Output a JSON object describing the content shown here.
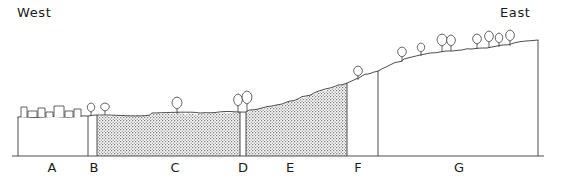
{
  "figure": {
    "type": "landscape-cross-section",
    "orientation_labels": {
      "west": "West",
      "east": "East"
    },
    "baseline_y": 156,
    "ground_left_x": 18,
    "ground_right_x": 538,
    "zones": [
      {
        "id": "A",
        "label": "A",
        "label_x": 52,
        "label_y": 168,
        "x_start": 18,
        "x_end": 88,
        "fill": "none",
        "top_y": 117,
        "surface_feature": "buildings"
      },
      {
        "id": "B",
        "label": "B",
        "label_x": 94,
        "label_y": 168,
        "x_start": 88,
        "x_end": 97,
        "fill": "none",
        "top_y": 116,
        "surface_feature": "trees"
      },
      {
        "id": "C",
        "label": "C",
        "label_x": 175,
        "label_y": 168,
        "x_start": 97,
        "x_end": 240,
        "fill": "stipple",
        "top_y": 115,
        "surface_feature": "tree"
      },
      {
        "id": "D",
        "label": "D",
        "label_x": 243,
        "label_y": 168,
        "x_start": 240,
        "x_end": 246,
        "fill": "none",
        "top_y": 112,
        "surface_feature": "trees"
      },
      {
        "id": "E",
        "label": "E",
        "label_x": 290,
        "label_y": 168,
        "x_start": 246,
        "x_end": 347,
        "fill": "stipple",
        "top_y": 110,
        "surface_feature": "slope"
      },
      {
        "id": "F",
        "label": "F",
        "label_x": 358,
        "label_y": 168,
        "x_start": 347,
        "x_end": 378,
        "fill": "none",
        "top_y": 84,
        "surface_feature": "tree"
      },
      {
        "id": "G",
        "label": "G",
        "label_x": 459,
        "label_y": 168,
        "x_start": 378,
        "x_end": 538,
        "fill": "none",
        "top_y": 41,
        "surface_feature": "trees"
      }
    ],
    "terrain_profile": "M18,117 L88,116 L97,115 L150,115 L152,113 L200,113 L240,112 L246,112 L250,110 L262,108 L272,106 L282,104 L290,101 L298,99 L306,96 L314,93 L322,90 L330,88 L338,85 L347,83 L356,79 L362,76 L368,74 L374,72 L380,70 L386,67 L392,64 L398,62 L404,59 L412,57 L420,55 L430,53 L440,52 L452,51 L462,50 L472,49 L482,48 L492,47 L502,45 L514,43 L526,41 L538,40",
    "trees": [
      {
        "x": 91,
        "base_y": 116,
        "height": 13,
        "canopy_w": 6,
        "canopy_h": 9
      },
      {
        "x": 105,
        "base_y": 115,
        "height": 12,
        "canopy_w": 7,
        "canopy_h": 8
      },
      {
        "x": 177,
        "base_y": 114,
        "height": 17,
        "canopy_w": 8,
        "canopy_h": 12
      },
      {
        "x": 238,
        "base_y": 113,
        "height": 19,
        "canopy_w": 7,
        "canopy_h": 12
      },
      {
        "x": 247,
        "base_y": 112,
        "height": 21,
        "canopy_w": 8,
        "canopy_h": 13
      },
      {
        "x": 358,
        "base_y": 80,
        "height": 14,
        "canopy_w": 7,
        "canopy_h": 10
      },
      {
        "x": 402,
        "base_y": 62,
        "height": 15,
        "canopy_w": 7,
        "canopy_h": 10
      },
      {
        "x": 421,
        "base_y": 56,
        "height": 13,
        "canopy_w": 6,
        "canopy_h": 9
      },
      {
        "x": 442,
        "base_y": 52,
        "height": 18,
        "canopy_w": 8,
        "canopy_h": 12
      },
      {
        "x": 451,
        "base_y": 51,
        "height": 16,
        "canopy_w": 7,
        "canopy_h": 11
      },
      {
        "x": 477,
        "base_y": 49,
        "height": 15,
        "canopy_w": 7,
        "canopy_h": 10
      },
      {
        "x": 489,
        "base_y": 48,
        "height": 17,
        "canopy_w": 7,
        "canopy_h": 11
      },
      {
        "x": 499,
        "base_y": 47,
        "height": 14,
        "canopy_w": 6,
        "canopy_h": 10
      },
      {
        "x": 510,
        "base_y": 46,
        "height": 16,
        "canopy_w": 7,
        "canopy_h": 11
      }
    ],
    "buildings": [
      {
        "x": 21,
        "y": 107,
        "w": 6,
        "h": 10
      },
      {
        "x": 28,
        "y": 111,
        "w": 9,
        "h": 6
      },
      {
        "x": 38,
        "y": 108,
        "w": 7,
        "h": 9
      },
      {
        "x": 46,
        "y": 112,
        "w": 7,
        "h": 5
      },
      {
        "x": 54,
        "y": 106,
        "w": 10,
        "h": 11
      },
      {
        "x": 65,
        "y": 111,
        "w": 8,
        "h": 6
      },
      {
        "x": 74,
        "y": 109,
        "w": 7,
        "h": 8
      }
    ],
    "colors": {
      "line": "#3a3a3a",
      "stipple": "#8a8a8a",
      "background": "#ffffff",
      "text": "#1a1a1a"
    }
  }
}
